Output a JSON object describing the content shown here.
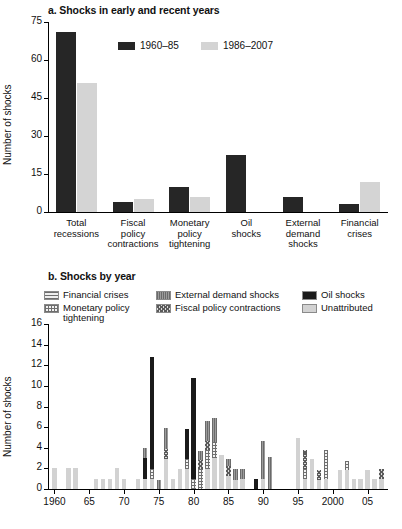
{
  "figure": {
    "panel_a": {
      "title": "a. Shocks in early and recent years",
      "ylabel": "Number of shocks",
      "legend": [
        {
          "label": "1960–85",
          "color": "#262626",
          "key": "early"
        },
        {
          "label": "1986–2007",
          "color": "#d4d4d4",
          "key": "recent"
        }
      ]
    },
    "panel_b": {
      "title": "b. Shocks by year",
      "ylabel": "Number of shocks",
      "legend": [
        {
          "label": "Financial crises",
          "pattern": "pat-financial"
        },
        {
          "label": "External demand shocks",
          "pattern": "pat-external"
        },
        {
          "label": "Oil shocks",
          "pattern": "pat-oil"
        },
        {
          "label": "Monetary policy tightening",
          "pattern": "pat-monetary"
        },
        {
          "label": "Fiscal policy contractions",
          "pattern": "pat-fiscal"
        },
        {
          "label": "Unattributed",
          "pattern": "pat-unattributed"
        }
      ]
    }
  },
  "chart_data": [
    {
      "type": "bar",
      "id": "panel-a",
      "title": "a. Shocks in early and recent years",
      "xlabel": "",
      "ylabel": "Number of shocks",
      "ylim": [
        0,
        75
      ],
      "yticks": [
        0,
        15,
        30,
        45,
        60,
        75
      ],
      "grid": false,
      "legend_position": "top-center",
      "categories": [
        "Total recessions",
        "Fiscal policy contractions",
        "Monetary policy tightening",
        "Oil shocks",
        "External demand shocks",
        "Financial crises"
      ],
      "series": [
        {
          "name": "1960–85",
          "color": "#262626",
          "values": [
            71,
            4,
            10,
            22.5,
            6,
            3
          ]
        },
        {
          "name": "1986–2007",
          "color": "#d4d4d4",
          "values": [
            51,
            5,
            6,
            0,
            0,
            12
          ]
        }
      ]
    },
    {
      "type": "bar",
      "id": "panel-b",
      "stacked": true,
      "title": "b. Shocks by year",
      "xlabel": "",
      "ylabel": "Number of shocks",
      "ylim": [
        0,
        16
      ],
      "yticks": [
        0,
        2,
        4,
        6,
        8,
        10,
        12,
        14,
        16
      ],
      "xticks": [
        "1960",
        "65",
        "70",
        "75",
        "80",
        "85",
        "90",
        "95",
        "2000",
        "05"
      ],
      "xlim": [
        1960,
        2007
      ],
      "grid": false,
      "legend_position": "top",
      "stack_order": [
        "Unattributed",
        "Monetary policy tightening",
        "Fiscal policy contractions",
        "Financial crises",
        "Oil shocks",
        "External demand shocks"
      ],
      "series": [
        {
          "name": "Unattributed",
          "pattern": "pat-unattributed",
          "values": [
            2,
            0,
            2,
            2,
            0,
            0,
            1,
            1,
            1,
            2,
            1,
            0,
            1,
            1,
            1,
            0,
            2.9,
            1,
            1.9,
            1.9,
            0,
            0,
            1.9,
            3,
            3.3,
            1.3,
            0.9,
            1,
            0,
            0,
            1,
            0,
            0,
            0,
            0,
            4.9,
            1,
            2.9,
            0.9,
            1,
            0,
            1.8,
            1.8,
            1,
            1,
            1.8,
            1,
            1,
            0,
            1.8,
            0,
            1
          ]
        },
        {
          "name": "Monetary policy tightening",
          "pattern": "pat-monetary",
          "values": [
            0,
            0,
            0,
            0,
            0,
            0,
            0,
            0,
            0,
            0,
            0,
            0,
            0,
            0,
            0.9,
            0,
            0,
            0,
            0,
            1,
            1,
            1.9,
            1.9,
            1.6,
            0,
            0,
            0,
            0,
            0,
            0,
            0,
            0,
            0,
            0,
            0,
            0,
            0.9,
            0,
            0,
            2.8,
            0,
            0,
            0.9,
            0,
            0,
            0,
            0,
            0,
            0,
            0,
            0,
            0
          ]
        },
        {
          "name": "Fiscal policy contractions",
          "pattern": "pat-fiscal",
          "values": [
            0,
            0,
            0,
            0,
            0,
            0,
            0,
            0,
            0,
            0,
            0,
            0,
            0,
            0,
            0,
            0,
            1,
            0,
            0,
            0,
            0,
            0.9,
            0.9,
            0,
            0,
            0.9,
            0,
            0,
            0,
            0,
            0,
            0,
            0,
            0,
            0,
            0,
            1.9,
            0,
            0.9,
            0,
            0,
            0,
            0,
            0,
            0,
            0,
            0,
            0.9,
            0,
            0,
            0,
            0
          ]
        },
        {
          "name": "Financial crises",
          "pattern": "pat-financial",
          "values": [
            0,
            0,
            0,
            0,
            0,
            0,
            0,
            0,
            0,
            0,
            0,
            0,
            0,
            0,
            0,
            0,
            0,
            0,
            0,
            0,
            0,
            0,
            0,
            0,
            0,
            0,
            0,
            0,
            0,
            0,
            0,
            0,
            0,
            0,
            0,
            0,
            0,
            0,
            0,
            0,
            0,
            0,
            0,
            0,
            0,
            0,
            0,
            0,
            0,
            0,
            0,
            0
          ]
        },
        {
          "name": "Oil shocks",
          "pattern": "pat-oil",
          "values": [
            0,
            0,
            0,
            0,
            0,
            0,
            0,
            0,
            0,
            0,
            0,
            0,
            0,
            2,
            10.9,
            0,
            0,
            0,
            0,
            2.9,
            9.8,
            0,
            0,
            0,
            0,
            0,
            0,
            0,
            0,
            1,
            0,
            0,
            0,
            0,
            0,
            0,
            0,
            0,
            0,
            0,
            0,
            0,
            0,
            0,
            0,
            0,
            0,
            0,
            0,
            0,
            0,
            0
          ]
        },
        {
          "name": "External demand shocks",
          "pattern": "pat-external",
          "values": [
            0,
            0,
            0,
            0,
            0,
            0,
            0,
            0,
            0,
            0,
            0,
            0,
            0,
            1,
            0,
            0.9,
            2,
            0,
            0,
            0,
            0,
            0.9,
            1.9,
            2.3,
            0,
            0.7,
            1,
            0.9,
            0,
            0,
            3.7,
            3.1,
            0,
            0,
            0,
            0,
            0,
            0,
            0,
            0,
            0,
            0,
            0,
            0,
            0,
            0,
            0,
            0,
            0,
            0,
            0,
            0
          ]
        }
      ],
      "years": [
        1960,
        1961,
        1962,
        1963,
        1964,
        1965,
        1966,
        1967,
        1968,
        1969,
        1970,
        1971,
        1972,
        1973,
        1974,
        1975,
        1976,
        1977,
        1978,
        1979,
        1980,
        1981,
        1982,
        1983,
        1984,
        1985,
        1986,
        1987,
        1988,
        1989,
        1990,
        1991,
        1992,
        1993,
        1994,
        1995,
        1996,
        1997,
        1998,
        1999,
        2000,
        2001,
        2002,
        2003,
        2004,
        2005,
        2006,
        2007
      ]
    }
  ]
}
